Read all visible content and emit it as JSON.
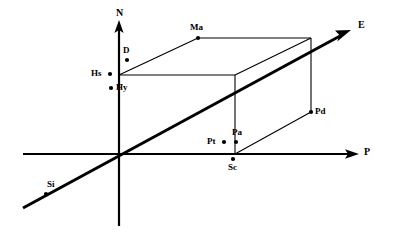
{
  "figure": {
    "background_color": "#ffffff",
    "ink_color": "#000000",
    "width": 393,
    "height": 236
  },
  "axes": [
    {
      "id": "axis-n",
      "label": "N",
      "orientation": "vertical",
      "label_x": 116,
      "label_y": 8,
      "arrow": true
    },
    {
      "id": "axis-p",
      "label": "P",
      "orientation": "horizontal",
      "label_x": 364,
      "label_y": 147,
      "arrow": true
    },
    {
      "id": "axis-e",
      "label": "E",
      "orientation": "oblique",
      "label_x": 358,
      "label_y": 20,
      "arrow": true
    }
  ],
  "geometry": {
    "origin": {
      "x": 119,
      "y": 154
    },
    "n_axis": {
      "x1": 119,
      "y1": 22,
      "x2": 119,
      "y2": 226
    },
    "p_axis": {
      "x1": 23,
      "y1": 154,
      "x2": 358,
      "y2": 154
    },
    "e_axis": {
      "x1": 23,
      "y1": 208,
      "x2": 350,
      "y2": 30
    },
    "box": {
      "front_top_left": {
        "x": 119,
        "y": 75
      },
      "front_top_right": {
        "x": 235,
        "y": 75
      },
      "front_bottom_right": {
        "x": 235,
        "y": 154
      },
      "back_top_left": {
        "x": 198,
        "y": 38
      },
      "back_top_right": {
        "x": 311,
        "y": 38
      },
      "back_bottom_right": {
        "x": 311,
        "y": 112
      }
    }
  },
  "points": [
    {
      "id": "point-d",
      "label": "D",
      "dot_x": 127,
      "dot_y": 60,
      "label_x": 123,
      "label_y": 46,
      "label_pos": "above"
    },
    {
      "id": "point-hs",
      "label": "Hs",
      "dot_x": 110,
      "dot_y": 74,
      "label_x": 91,
      "label_y": 69,
      "label_pos": "left"
    },
    {
      "id": "point-hy",
      "label": "Hy",
      "dot_x": 111,
      "dot_y": 88,
      "label_x": 116,
      "label_y": 83,
      "label_pos": "right"
    },
    {
      "id": "point-ma",
      "label": "Ma",
      "dot_x": 198,
      "dot_y": 38,
      "label_x": 190,
      "label_y": 23,
      "label_pos": "above"
    },
    {
      "id": "point-pd",
      "label": "Pd",
      "dot_x": 311,
      "dot_y": 112,
      "label_x": 315,
      "label_y": 107,
      "label_pos": "right"
    },
    {
      "id": "point-pt",
      "label": "Pt",
      "dot_x": 224,
      "dot_y": 142,
      "label_x": 207,
      "label_y": 137,
      "label_pos": "left"
    },
    {
      "id": "point-pa",
      "label": "Pa",
      "dot_x": 236,
      "dot_y": 142,
      "label_x": 232,
      "label_y": 128,
      "label_pos": "above"
    },
    {
      "id": "point-sc",
      "label": "Sc",
      "dot_x": 233,
      "dot_y": 159,
      "label_x": 228,
      "label_y": 163,
      "label_pos": "below"
    },
    {
      "id": "point-si",
      "label": "Si",
      "dot_x": 46,
      "dot_y": 194,
      "label_x": 47,
      "label_y": 180,
      "label_pos": "above"
    }
  ]
}
